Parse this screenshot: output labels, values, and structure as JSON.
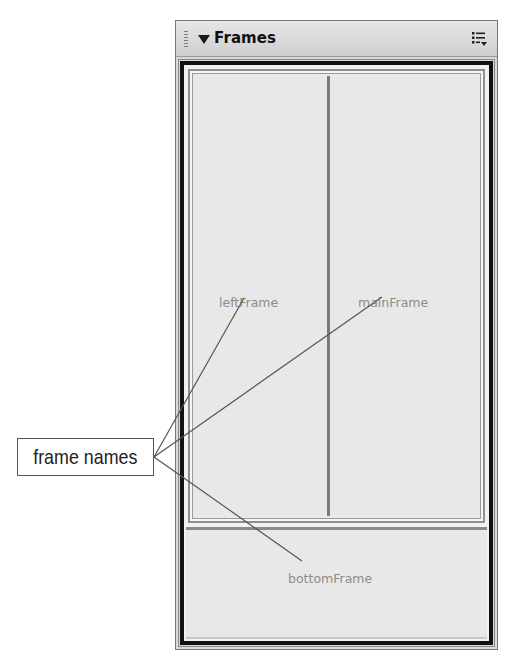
{
  "panel": {
    "title": "Frames",
    "collapse_icon": "triangle-down-icon",
    "grip_icon": "drag-grip-icon",
    "options_icon": "panel-options-menu-icon"
  },
  "frames": {
    "left": {
      "name": "leftFrame"
    },
    "main": {
      "name": "mainFrame"
    },
    "bottom": {
      "name": "bottomFrame"
    }
  },
  "callout": {
    "label": "frame names",
    "targets": [
      "leftFrame",
      "mainFrame",
      "bottomFrame"
    ]
  },
  "colors": {
    "frame_border": "#111111",
    "frame_fill": "#e8e8e8",
    "label_text": "#8c8c8c",
    "leader_line": "#555555"
  }
}
